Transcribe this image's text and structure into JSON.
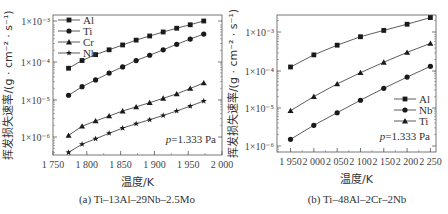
{
  "chart_data": [
    {
      "type": "line",
      "panel": "a",
      "caption": "(a) Ti–13Al–29Nb–2.5Mo",
      "xlabel": "温度/K",
      "ylabel": "挥发损失速率/(g · cm⁻² · s⁻¹)",
      "xlim": [
        1750,
        2000
      ],
      "xticks": [
        "1 750",
        "1 800",
        "1 850",
        "1 900",
        "1 950",
        "2 000"
      ],
      "yscale": "log",
      "ylim": [
        3e-07,
        0.0015
      ],
      "yticks": [
        "1×10⁻⁶",
        "1×10⁻⁵",
        "1×10⁻⁴",
        "1×10⁻³"
      ],
      "annotation": "p=1.333 Pa",
      "legend_position": "upper left",
      "x": [
        1773,
        1793,
        1813,
        1833,
        1853,
        1873,
        1893,
        1913,
        1933,
        1953,
        1973
      ],
      "series": [
        {
          "name": "Al",
          "marker": "square",
          "values": [
            6e-05,
            9.5e-05,
            0.000135,
            0.00018,
            0.00024,
            0.00032,
            0.00041,
            0.00052,
            0.00065,
            0.0008,
            0.001
          ]
        },
        {
          "name": "Ti",
          "marker": "circle",
          "values": [
            1.2e-05,
            2e-05,
            3e-05,
            4.5e-05,
            6.5e-05,
            9.5e-05,
            0.00013,
            0.00018,
            0.00025,
            0.00034,
            0.00046
          ]
        },
        {
          "name": "Cr",
          "marker": "triangle",
          "values": [
            1.1e-06,
            1.9e-06,
            2.6e-06,
            3.5e-06,
            4.7e-06,
            6e-06,
            7.7e-06,
            1e-05,
            1.3e-05,
            1.8e-05,
            2.5e-05
          ]
        },
        {
          "name": "Nb",
          "marker": "star",
          "values": [
            4e-07,
            6.5e-07,
            9e-07,
            1.25e-06,
            1.7e-06,
            2.2e-06,
            2.8e-06,
            3.6e-06,
            4.7e-06,
            6.3e-06,
            8.5e-06
          ]
        }
      ]
    },
    {
      "type": "line",
      "panel": "b",
      "caption": "(b) Ti–48Al–2Cr–2Nb",
      "xlabel": "温度/K",
      "ylabel": "挥发损失速率/(g · cm⁻² · s⁻¹)",
      "xlim": [
        1925,
        2265
      ],
      "xticks": [
        "1 950",
        "2 000",
        "2 050",
        "2 100",
        "2 150",
        "2 200",
        "2 250"
      ],
      "yscale": "log",
      "ylim": [
        8e-07,
        0.003
      ],
      "yticks": [
        "1×10⁻⁶",
        "1×10⁻⁵",
        "1×10⁻⁴",
        "1×10⁻³"
      ],
      "annotation": "p=1.333 Pa",
      "legend_position": "lower right",
      "x": [
        1950,
        2000,
        2050,
        2100,
        2150,
        2200,
        2250
      ],
      "series": [
        {
          "name": "Al",
          "marker": "square",
          "values": [
            0.00012,
            0.00025,
            0.00045,
            0.00075,
            0.0011,
            0.0016,
            0.0024
          ]
        },
        {
          "name": "Nb",
          "marker": "circle",
          "values": [
            1.5e-06,
            3.5e-06,
            7.5e-06,
            1.6e-05,
            3.3e-05,
            6.5e-05,
            0.000125
          ]
        },
        {
          "name": "Ti",
          "marker": "triangle",
          "values": [
            8.5e-06,
            2e-05,
            4.3e-05,
            8.5e-05,
            0.00016,
            0.00029,
            0.0005
          ]
        }
      ]
    }
  ]
}
